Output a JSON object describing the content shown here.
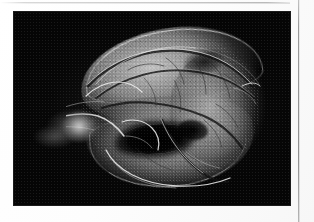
{
  "page": {
    "background_color": "#ffffff",
    "top_rule_color": "#c9c9c9",
    "column_rule_color": "#8f8f8f"
  },
  "figure": {
    "kind": "angiographic-radiograph",
    "modality": "contrast radiography / angiogram",
    "plate_background_color": "#000000",
    "tone": "grayscale",
    "features": [
      "superior capsular rim highlight",
      "arching superior vessel arcade",
      "dense intraparenchymal vascular network",
      "dark hilar cavity",
      "left vascular pedicle fan",
      "inferior border vessel loop"
    ],
    "bounds": {
      "x": 14,
      "y": 12,
      "width": 276,
      "height": 193
    }
  }
}
